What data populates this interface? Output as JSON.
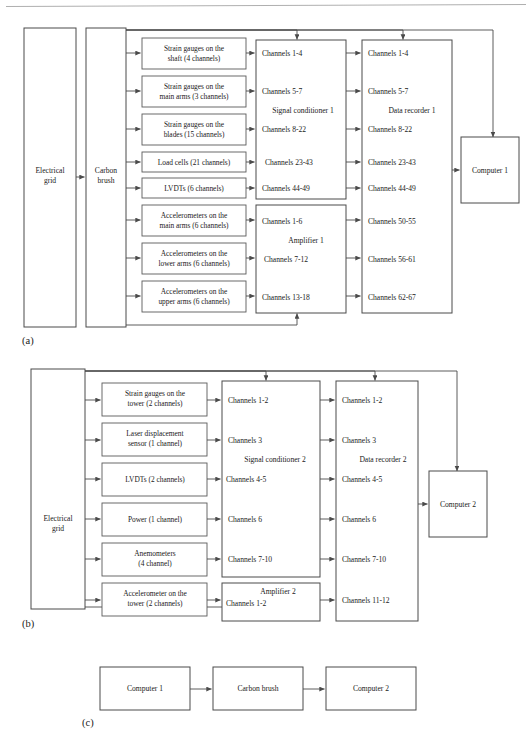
{
  "figure": {
    "panels": [
      {
        "id": "a",
        "caption": "(a)",
        "source": {
          "label_line1": "Electrical",
          "label_line2": "grid"
        },
        "brush": {
          "label_line1": "Carbon",
          "label_line2": "brush"
        },
        "sensors": [
          {
            "line1": "Strain gauges on the",
            "line2": "shaft (4 channels)"
          },
          {
            "line1": "Strain gauges on the",
            "line2": "main arms (3 channels)"
          },
          {
            "line1": "Strain gauges on the",
            "line2": "blades (15 channels)"
          },
          {
            "line1": "Load cells (21 channels)",
            "line2": ""
          },
          {
            "line1": "LVDTs (6 channels)",
            "line2": ""
          },
          {
            "line1": "Accelerometers on the",
            "line2": "main arms (6 channels)"
          },
          {
            "line1": "Accelerometers on the",
            "line2": "lower arms (6 channels)"
          },
          {
            "line1": "Accelerometers on the",
            "line2": "upper arms (6 channels)"
          }
        ],
        "conditioner": {
          "title": "Signal conditioner 1",
          "channels": [
            "Channels 1-4",
            "Channels 5-7",
            "Channels 8-22",
            "Channels 23-43",
            "Channels 44-49"
          ]
        },
        "amplifier": {
          "title": "Amplifier 1",
          "channels": [
            "Channels 1-6",
            "Channels 7-12",
            "Channels 13-18"
          ]
        },
        "recorder": {
          "title": "Data recorder 1",
          "channels": [
            "Channels 1-4",
            "Channels 5-7",
            "Channels 8-22",
            "Channels 23-43",
            "Channels 44-49",
            "Channels 50-55",
            "Channels 56-61",
            "Channels 62-67"
          ]
        },
        "computer": {
          "label": "Computer 1"
        }
      },
      {
        "id": "b",
        "caption": "(b)",
        "source": {
          "label_line1": "Electrical",
          "label_line2": "grid"
        },
        "sensors": [
          {
            "line1": "Strain gauges on the",
            "line2": "tower (2 channels)"
          },
          {
            "line1": "Laser displacement",
            "line2": "sensor (1 channel)"
          },
          {
            "line1": "LVDTs (2 channels)",
            "line2": ""
          },
          {
            "line1": "Power (1 channel)",
            "line2": ""
          },
          {
            "line1": "Anemometers",
            "line2": "(4 channel)"
          },
          {
            "line1": "Accelerometer on the",
            "line2": "tower (2 channels)"
          }
        ],
        "conditioner": {
          "title": "Signal conditioner 2",
          "channels": [
            "Channels 1-2",
            "Channels 3",
            "Channels 4-5",
            "Channels 6",
            "Channels 7-10"
          ]
        },
        "amplifier": {
          "title": "Amplifier 2",
          "channels": [
            "Channels 1-2"
          ]
        },
        "recorder": {
          "title": "Data recorder 2",
          "channels": [
            "Channels 1-2",
            "Channels 3",
            "Channels 4-5",
            "Channels 6",
            "Channels 7-10",
            "Channels 11-12"
          ]
        },
        "computer": {
          "label": "Computer 2"
        }
      },
      {
        "id": "c",
        "caption": "(c)",
        "nodes": [
          {
            "label": "Computer 1"
          },
          {
            "label": "Carbon brush"
          },
          {
            "label": "Computer 2"
          }
        ]
      }
    ]
  },
  "colors": {
    "box_stroke": "#4a4a4a",
    "line": "#4a4a4a",
    "text": "#1a1a1a",
    "background": "#ffffff"
  }
}
